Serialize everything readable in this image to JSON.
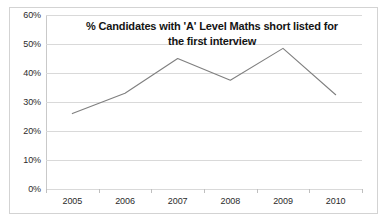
{
  "chart_data": {
    "type": "line",
    "title": "% Candidates with 'A' Level Maths short listed for the first interview",
    "title_line_1": "% Candidates with 'A' Level Maths short listed for",
    "title_line_2": "the first interview",
    "xlabel": "",
    "ylabel": "",
    "categories": [
      "2005",
      "2006",
      "2007",
      "2008",
      "2009",
      "2010"
    ],
    "values": [
      26,
      33,
      45,
      37.5,
      48.5,
      32.5
    ],
    "series": [
      {
        "name": "% Candidates with 'A' Level Maths short listed for the first interview",
        "values": [
          26,
          33,
          45,
          37.5,
          48.5,
          32.5
        ]
      }
    ],
    "ylim": [
      0,
      60
    ],
    "ytick_values": [
      0,
      10,
      20,
      30,
      40,
      50,
      60
    ],
    "ytick_labels": [
      "0%",
      "10%",
      "20%",
      "30%",
      "40%",
      "50%",
      "60%"
    ],
    "ytick_step": 10,
    "grid": true,
    "grid_axis": "y",
    "legend": false,
    "legend_position": "none",
    "markers": false,
    "line_color": "#7f7f7f",
    "gridline_color": "#d9d9d9",
    "axis_color": "#bfbfbf",
    "border_color": "#d3d3d3",
    "background_color": "#ffffff",
    "text_color": "#2b2b2b",
    "title_color": "#141414"
  }
}
